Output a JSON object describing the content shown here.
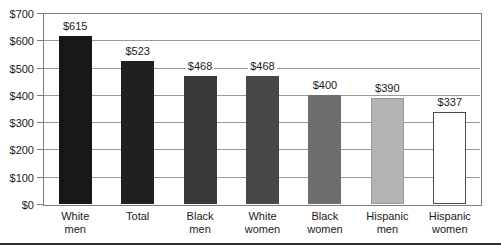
{
  "chart_data": {
    "type": "bar",
    "title": "",
    "xlabel": "",
    "ylabel": "",
    "categories": [
      [
        "White",
        "men"
      ],
      [
        "Total"
      ],
      [
        "Black",
        "men"
      ],
      [
        "White",
        "women"
      ],
      [
        "Black",
        "women"
      ],
      [
        "Hispanic",
        "men"
      ],
      [
        "Hispanic",
        "women"
      ]
    ],
    "values": [
      615,
      523,
      468,
      468,
      400,
      390,
      337
    ],
    "value_labels": [
      "$615",
      "$523",
      "$468",
      "$468",
      "$400",
      "$390",
      "$337"
    ],
    "bar_colors": [
      "#171717",
      "#202020",
      "#3a3a3a",
      "#484848",
      "#6e6e6e",
      "#b4b4b4",
      "#ffffff"
    ],
    "bar_border_colors": [
      "#171717",
      "#202020",
      "#3a3a3a",
      "#484848",
      "#6e6e6e",
      "#999999",
      "#4a4a4a"
    ],
    "ylim": [
      0,
      700
    ],
    "ytick_interval": 100,
    "ytick_labels": [
      "$0",
      "$100",
      "$200",
      "$300",
      "$400",
      "$500",
      "$600",
      "$700"
    ],
    "grid": true,
    "legend": "none"
  },
  "colors": {
    "gridline": "#9a9a9a",
    "frame": "#7d7d7d",
    "text": "#1a1a1a",
    "bottom_rule": "#2e2e2e",
    "background": "#ffffff"
  }
}
